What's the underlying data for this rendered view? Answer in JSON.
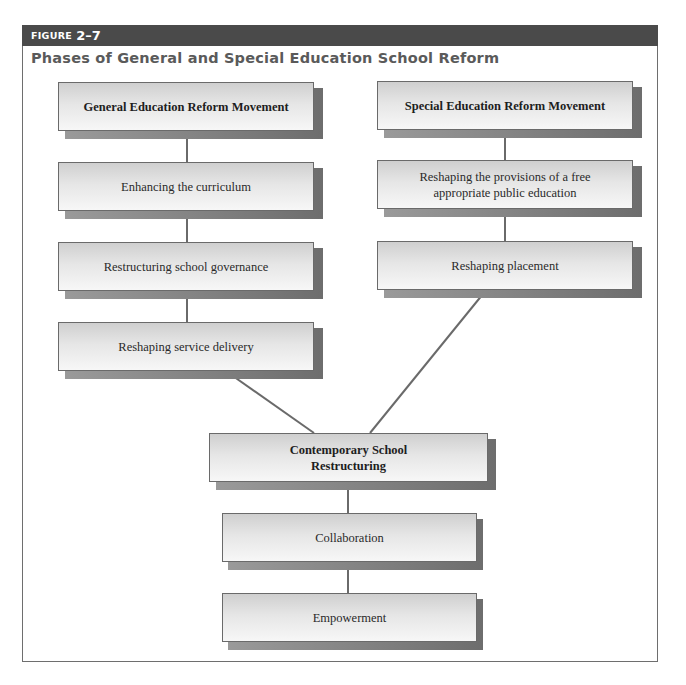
{
  "figure": {
    "label_word": "FIGURE",
    "label_number": "2–7",
    "title": "Phases of General and Special Education School Reform"
  },
  "diagram": {
    "left_column": {
      "heading": "General Education Reform Movement",
      "steps": [
        "Enhancing the curriculum",
        "Restructuring school governance",
        "Reshaping service delivery"
      ]
    },
    "right_column": {
      "heading": "Special Education Reform Movement",
      "steps": [
        "Reshaping the provisions of a free appropriate public education",
        "Reshaping placement"
      ]
    },
    "merged_column": {
      "heading": "Contemporary School Restructuring",
      "steps": [
        "Collaboration",
        "Empowerment"
      ]
    },
    "colors": {
      "header_bar": "#4a4a4a",
      "title_text": "#5a5a5a",
      "box_border": "#6a6a6a",
      "connector": "#6a6a6a"
    }
  }
}
